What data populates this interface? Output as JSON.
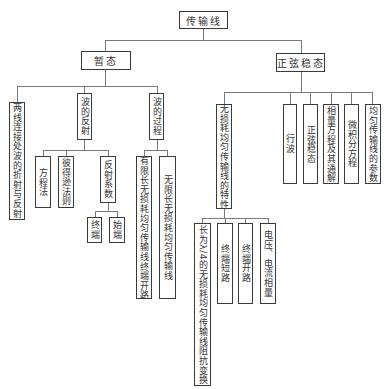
{
  "root": {
    "label": "传输线"
  },
  "transient": {
    "label": "暂态",
    "children": {
      "refraction": {
        "label": "两线连接处波的折射与反射"
      },
      "reflection": {
        "label": "波的反射",
        "children": {
          "equation_method": {
            "label": "方程法"
          },
          "peterson_rule": {
            "label": "彼得逊法则"
          },
          "reflection_coef": {
            "label": "反射系数",
            "children": {
              "terminal_end": {
                "label": "终端"
              },
              "source_end": {
                "label": "始端"
              }
            }
          }
        }
      },
      "wave_process": {
        "label": "波的过程",
        "children": {
          "finite_open": {
            "label": "有限长无损耗均匀传输线终端开路"
          },
          "infinite": {
            "label": "无限长无损耗均匀传输线"
          }
        }
      }
    }
  },
  "steady": {
    "label": "正弦稳态",
    "children": {
      "lossless_props": {
        "label": "无损耗均匀传输线的特性",
        "children": {
          "quarter_wave": {
            "label": "长为λ/4的无损耗均匀传输线阻抗变换"
          },
          "short_circuit": {
            "label": "终端短路"
          },
          "open_circuit": {
            "label": "终端开路"
          },
          "phasor": {
            "label": "电压、电流相量"
          }
        }
      },
      "traveling_wave": {
        "label": "行波"
      },
      "sine_steady": {
        "label": "正弦稳态"
      },
      "phasor_equation": {
        "label": "相量方程及其通解"
      },
      "diff_equation": {
        "label": "微积分方程"
      },
      "parameters": {
        "label": "均匀传输线的参数"
      }
    }
  }
}
